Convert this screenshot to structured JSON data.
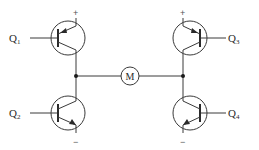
{
  "diagram": {
    "type": "H-bridge motor driver circuit",
    "motor": {
      "label": "M"
    },
    "transistors": [
      {
        "id": "Q1",
        "letter": "Q",
        "subscript": "1",
        "position": "top-left",
        "polarity": "PNP",
        "supply_terminal": "+"
      },
      {
        "id": "Q2",
        "letter": "Q",
        "subscript": "2",
        "position": "bottom-left",
        "polarity": "NPN",
        "supply_terminal": "−"
      },
      {
        "id": "Q3",
        "letter": "Q",
        "subscript": "3",
        "position": "top-right",
        "polarity": "PNP",
        "supply_terminal": "+"
      },
      {
        "id": "Q4",
        "letter": "Q",
        "subscript": "4",
        "position": "bottom-right",
        "polarity": "NPN",
        "supply_terminal": "−"
      }
    ],
    "terminals": {
      "positive": "+",
      "negative": "−"
    },
    "colors": {
      "line": "#3a3a3a",
      "background": "#ffffff"
    }
  }
}
